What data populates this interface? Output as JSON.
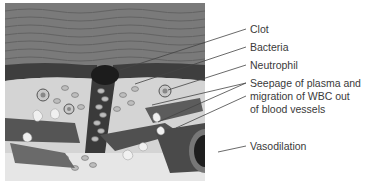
{
  "figure": {
    "labels": [
      {
        "id": "clot",
        "text": "Clot"
      },
      {
        "id": "bacteria",
        "text": "Bacteria"
      },
      {
        "id": "neutrophil",
        "text": "Neutrophil"
      },
      {
        "id": "seepage",
        "lines": [
          "Seepage of plasma and",
          "migration of WBC out",
          "of blood vessels"
        ]
      },
      {
        "id": "vasodilation",
        "text": "Vasodilation"
      }
    ],
    "colors": {
      "label_text": "#3a3a3a",
      "leader_line": "#444444",
      "tissue_dark": "#5a5a5a",
      "tissue_light": "#d9d9d9",
      "clot": "#1c1c1c"
    }
  }
}
